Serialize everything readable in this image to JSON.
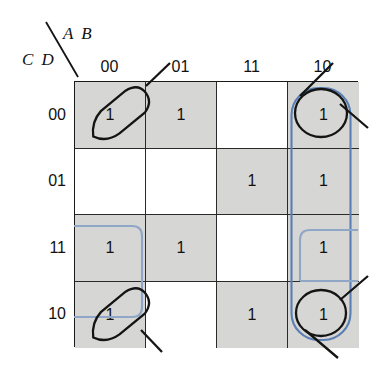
{
  "diagram": {
    "type": "karnaugh-map",
    "variables_top": "A B",
    "variables_side": "C D",
    "column_headers": [
      "00",
      "01",
      "11",
      "10"
    ],
    "row_headers": [
      "00",
      "01",
      "11",
      "10"
    ],
    "cells": [
      [
        {
          "value": "1",
          "shaded": true
        },
        {
          "value": "1",
          "shaded": true
        },
        {
          "value": "",
          "shaded": false
        },
        {
          "value": "1",
          "shaded": true
        }
      ],
      [
        {
          "value": "",
          "shaded": false
        },
        {
          "value": "",
          "shaded": false
        },
        {
          "value": "1",
          "shaded": true
        },
        {
          "value": "1",
          "shaded": true
        }
      ],
      [
        {
          "value": "1",
          "shaded": true
        },
        {
          "value": "1",
          "shaded": true
        },
        {
          "value": "",
          "shaded": false
        },
        {
          "value": "1",
          "shaded": true
        }
      ],
      [
        {
          "value": "1",
          "shaded": true
        },
        {
          "value": "",
          "shaded": false
        },
        {
          "value": "1",
          "shaded": true
        },
        {
          "value": "1",
          "shaded": true
        }
      ]
    ],
    "colors": {
      "grid_line": "#2a2a2a",
      "shaded_cell": "#d6d6d4",
      "empty_cell": "#ffffff",
      "blue_group": "#5b7fb4",
      "black_group": "#111111",
      "text": "#111111",
      "background": "#ffffff"
    },
    "groups": [
      {
        "name": "blue-vertical-column-10",
        "color": "#5b7fb4",
        "style": "rounded-rect"
      },
      {
        "name": "blue-wrap-column-00-rows-11-10",
        "color": "#5b7fb4",
        "style": "rounded-rect"
      },
      {
        "name": "blue-wrap-row-11-left",
        "color": "#5b7fb4",
        "style": "rounded-rect"
      },
      {
        "name": "blue-wrap-row-11-right",
        "color": "#5b7fb4",
        "style": "rounded-rect"
      },
      {
        "name": "black-loop-top-left",
        "color": "#111111",
        "style": "hand-drawn-loop"
      },
      {
        "name": "black-loop-top-right",
        "color": "#111111",
        "style": "hand-drawn-loop"
      },
      {
        "name": "black-loop-bottom-left",
        "color": "#111111",
        "style": "hand-drawn-loop"
      },
      {
        "name": "black-loop-bottom-right",
        "color": "#111111",
        "style": "hand-drawn-loop"
      }
    ]
  }
}
